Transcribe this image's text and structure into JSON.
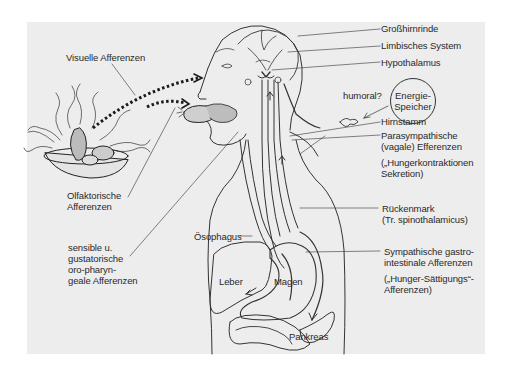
{
  "diagram": {
    "topic": "Afferent and efferent pathways of hunger/satiety regulation",
    "labels": {
      "visual_afferents": "Visuelle Afferenzen",
      "olfactory_afferents": "Olfaktorische\nAfferenzen",
      "oropharyngeal_afferents": "sensible u.\ngustatorische\noro-pharyn-\ngeale Afferenzen",
      "cerebral_cortex": "Großhirnrinde",
      "limbic_system": "Limbisches System",
      "hypothalamus": "Hypothalamus",
      "humoral": "humoral?",
      "energy_store": "Energie-\nSpeicher",
      "brainstem": "Hirnstamm",
      "parasympathetic_efferents": "Parasympathische\n(vagale) Efferenzen",
      "hunger_contractions": "(„Hungerkontraktionen\nSekretion)",
      "spinal_cord": "Rückenmark\n(Tr. spinothalamicus)",
      "sympathetic_afferents": "Sympathische gastro-\nintestinale Afferenzen",
      "hunger_satiety_afferents": "(„Hunger-Sättigungs“-\nAfferenzen)",
      "esophagus": "Ösophagus",
      "liver": "Leber",
      "stomach": "Magen",
      "pancreas": "Pankreas"
    },
    "colors": {
      "panel_background": "#ededed",
      "line": "#333333",
      "dotted_arrow": "#1a1a1a",
      "text": "#2a2a2a"
    }
  }
}
